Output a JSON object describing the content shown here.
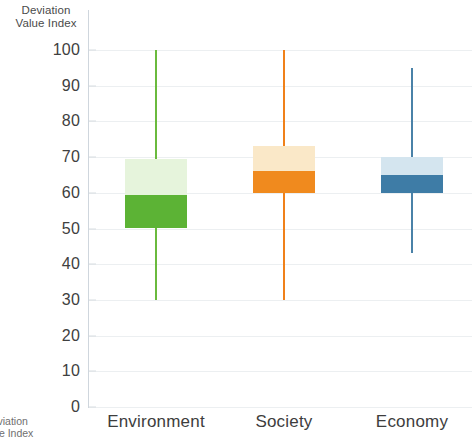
{
  "chart_data": {
    "type": "box",
    "title": "Deviation Value Index",
    "title_bottom": "Deviation Value Index",
    "xlabel": "",
    "ylabel": "Deviation Value Index",
    "ylim": [
      0,
      100
    ],
    "yticks": [
      100,
      90,
      80,
      70,
      60,
      50,
      40,
      30,
      20,
      10,
      0
    ],
    "grid": true,
    "legend": "none",
    "categories": [
      "Environment",
      "Society",
      "Economy"
    ],
    "series": [
      {
        "name": "Environment",
        "color_dark": "#5cb335",
        "color_light": "#e6f4dc",
        "color_line": "#6aba3e",
        "whisker_high": 100,
        "box_top": 69.5,
        "median": 59.5,
        "box_bottom": 50,
        "whisker_low": 30
      },
      {
        "name": "Society",
        "color_dark": "#f08a1e",
        "color_light": "#fae8c8",
        "color_line": "#f0811a",
        "whisker_high": 100,
        "box_top": 73,
        "median": 66,
        "box_bottom": 60,
        "whisker_low": 30
      },
      {
        "name": "Economy",
        "color_dark": "#3e7ca6",
        "color_light": "#d4e5ef",
        "color_line": "#4a82a8",
        "whisker_high": 95,
        "box_top": 70,
        "median": 65,
        "box_bottom": 60,
        "whisker_low": 43
      }
    ],
    "axis_color": "#cfd6dd",
    "grid_color": "#eceff1"
  },
  "yticks_text": [
    "100",
    "90",
    "80",
    "70",
    "60",
    "50",
    "40",
    "30",
    "20",
    "10",
    "0"
  ],
  "categories_text": [
    "Environment",
    "Society",
    "Economy"
  ],
  "title_text": {
    "line1": "Deviation",
    "line2": "Value Index"
  },
  "title_bottom_text": {
    "line1": "Deviation",
    "line2": "Value Index"
  }
}
